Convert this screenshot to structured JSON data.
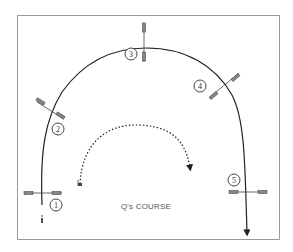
{
  "diagram": {
    "title": "Q's COURSE",
    "obstacles": [
      {
        "number": "1",
        "label": "1"
      },
      {
        "number": "2",
        "label": "2"
      },
      {
        "number": "3",
        "label": "3"
      },
      {
        "number": "4",
        "label": "4"
      },
      {
        "number": "5",
        "label": "5"
      }
    ],
    "colors": {
      "line": "#222222",
      "frame": "#888888",
      "pole": "#666666",
      "text": "#555555"
    }
  }
}
